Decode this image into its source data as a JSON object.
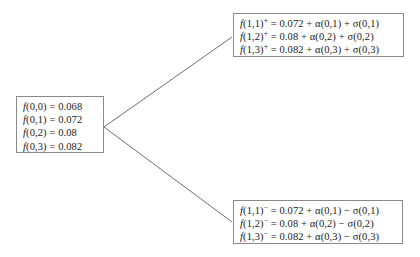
{
  "diagram": {
    "type": "binomial-tree",
    "title": "",
    "nodes": {
      "root": {
        "name": "root-node",
        "lines": [
          {
            "fn": "f",
            "args": "(0,0)",
            "sign": "",
            "rest": " = 0.068"
          },
          {
            "fn": "f",
            "args": "(0,1)",
            "sign": "",
            "rest": " = 0.072"
          },
          {
            "fn": "f",
            "args": "(0,2)",
            "sign": "",
            "rest": " = 0.08"
          },
          {
            "fn": "f",
            "args": "(0,3)",
            "sign": "",
            "rest": " = 0.082"
          }
        ],
        "text": [
          "f(0,0) = 0.068",
          "f(0,1) = 0.072",
          "f(0,2) = 0.08",
          "f(0,3) = 0.082"
        ]
      },
      "up": {
        "name": "up-node",
        "lines": [
          {
            "fn": "f",
            "args": "(1,1)",
            "sign": "+",
            "rest": " = 0.072 + α(0,1) + σ(0,1)"
          },
          {
            "fn": "f",
            "args": "(1,2)",
            "sign": "+",
            "rest": " = 0.08 + α(0,2) + σ(0,2)"
          },
          {
            "fn": "f",
            "args": "(1,3)",
            "sign": "+",
            "rest": " = 0.082 + α(0,3) + σ(0,3)"
          }
        ],
        "text": [
          "f(1,1)+ = 0.072 + α(0,1) + σ(0,1)",
          "f(1,2)+ = 0.08 + α(0,2) + σ(0,2)",
          "f(1,3)+ = 0.082 + α(0,3) + σ(0,3)"
        ]
      },
      "down": {
        "name": "down-node",
        "lines": [
          {
            "fn": "f",
            "args": "(1,1)",
            "sign": "−",
            "rest": " = 0.072 + α(0,1) − σ(0,1)"
          },
          {
            "fn": "f",
            "args": "(1,2)",
            "sign": "−",
            "rest": " = 0.08 + α(0,2) − σ(0,2)"
          },
          {
            "fn": "f",
            "args": "(1,3)",
            "sign": "−",
            "rest": " = 0.082 + α(0,3) −  σ(0,3)"
          }
        ],
        "text": [
          "f(1,1)− = 0.072 + α(0,1) − σ(0,1)",
          "f(1,2)− = 0.08 + α(0,2) − σ(0,2)",
          "f(1,3)− = 0.082 + α(0,3) −  σ(0,3)"
        ]
      }
    },
    "edges": [
      {
        "name": "edge-up",
        "from": "root",
        "to": "up",
        "x1": 104,
        "y1": 127,
        "x2": 232,
        "y2": 37
      },
      {
        "name": "edge-down",
        "from": "root",
        "to": "down",
        "x1": 104,
        "y1": 127,
        "x2": 232,
        "y2": 222
      }
    ],
    "colors": {
      "background": "#ffffff",
      "box_border": "#8a8a8a",
      "edge_line": "#6e6e6e",
      "text": "#1b1b1b"
    }
  }
}
